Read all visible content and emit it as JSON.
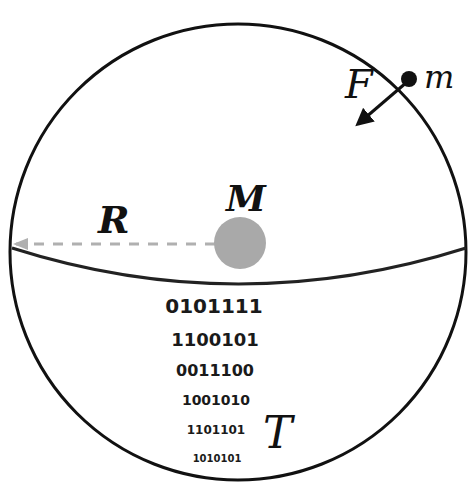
{
  "labels": {
    "force": "F",
    "test_mass": "m",
    "central_mass": "M",
    "radius": "R",
    "temperature": "T"
  },
  "binary_lines": [
    "0101111",
    "1100101",
    "0011100",
    "1001010",
    "1101101",
    "1010101"
  ],
  "colors": {
    "outline": "#111111",
    "central_mass": "#a9a9a9",
    "radius_line": "#b0b0b0"
  }
}
